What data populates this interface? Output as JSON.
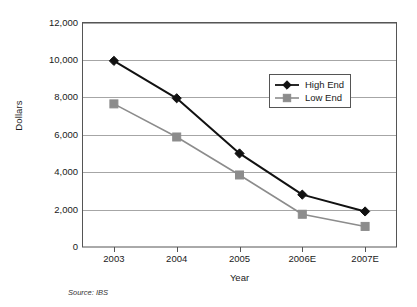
{
  "chart_data": {
    "type": "line",
    "title": "",
    "xlabel": "Year",
    "ylabel": "Dollars",
    "categories": [
      "2003",
      "2004",
      "2005",
      "2006E",
      "2007E"
    ],
    "ylim": [
      0,
      12000
    ],
    "ytick_labels": [
      "12,000",
      "10,000",
      "8,000",
      "6,000",
      "4,000",
      "2,000",
      "0"
    ],
    "ytick_values": [
      12000,
      10000,
      8000,
      6000,
      4000,
      2000,
      0
    ],
    "grid": true,
    "legend_position": "upper-right-inside",
    "series": [
      {
        "name": "High End",
        "color": "#111111",
        "marker": "diamond",
        "values": [
          9950,
          7950,
          5000,
          2800,
          1900
        ]
      },
      {
        "name": "Low End",
        "color": "#8c8c8c",
        "marker": "square",
        "values": [
          7650,
          5880,
          3850,
          1750,
          1100
        ]
      }
    ],
    "annotations": [
      {
        "name": "source",
        "text": "Source: IBS"
      }
    ]
  },
  "colors": {
    "high_end": "#111111",
    "low_end": "#8c8c8c",
    "grid": "#a6a6a6",
    "axis": "#555555",
    "background": "#ffffff"
  },
  "source": {
    "text": "Source: IBS"
  },
  "legend": {
    "entries": [
      {
        "label": "High End"
      },
      {
        "label": "Low End"
      }
    ]
  }
}
